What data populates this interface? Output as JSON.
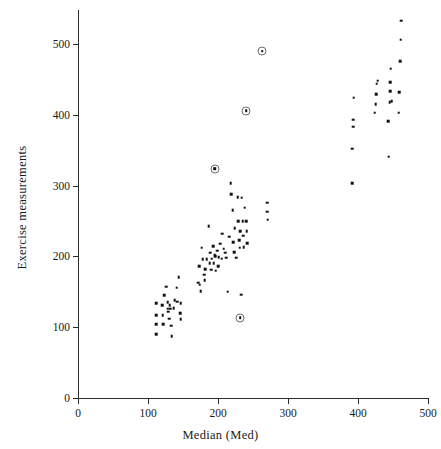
{
  "chart_data": {
    "type": "scatter",
    "title": "",
    "xlabel": "Median (Med)",
    "ylabel": "Exercise measurements",
    "xlim": [
      0,
      500
    ],
    "ylim": [
      0,
      545
    ],
    "xticks": [
      0,
      100,
      200,
      300,
      400,
      500
    ],
    "yticks": [
      0,
      100,
      200,
      300,
      400,
      500
    ],
    "xtick_labels": [
      "0",
      "100",
      "200",
      "300",
      "400",
      "500"
    ],
    "ytick_labels": [
      "0",
      "100",
      "200",
      "300",
      "400",
      "500"
    ],
    "grid": false,
    "legend": null,
    "marker": "small-filled-square",
    "marker_color": "#111111",
    "highlight_marker": "dot-in-open-circle",
    "highlight_marker_color": "#6d6d6d",
    "series": [
      {
        "name": "observations",
        "marker": "dot",
        "points": [
          [
            112,
            134
          ],
          [
            112,
            117
          ],
          [
            112,
            104
          ],
          [
            112,
            90
          ],
          [
            120,
            131
          ],
          [
            121,
            117
          ],
          [
            122,
            104
          ],
          [
            123,
            145
          ],
          [
            126,
            157
          ],
          [
            128,
            135
          ],
          [
            128,
            126
          ],
          [
            129,
            122
          ],
          [
            130,
            112
          ],
          [
            131,
            131
          ],
          [
            132,
            126
          ],
          [
            133,
            102
          ],
          [
            134,
            87
          ],
          [
            137,
            127
          ],
          [
            138,
            138
          ],
          [
            141,
            156
          ],
          [
            142,
            136
          ],
          [
            144,
            171
          ],
          [
            146,
            120
          ],
          [
            147,
            134
          ],
          [
            147,
            111
          ],
          [
            172,
            163
          ],
          [
            173,
            186
          ],
          [
            174,
            160
          ],
          [
            175,
            151
          ],
          [
            177,
            212
          ],
          [
            178,
            196
          ],
          [
            180,
            174
          ],
          [
            181,
            166
          ],
          [
            182,
            182
          ],
          [
            184,
            196
          ],
          [
            187,
            243
          ],
          [
            188,
            190
          ],
          [
            189,
            205
          ],
          [
            190,
            181
          ],
          [
            191,
            197
          ],
          [
            193,
            214
          ],
          [
            194,
            190
          ],
          [
            195,
            202
          ],
          [
            196,
            200
          ],
          [
            197,
            180
          ],
          [
            199,
            208
          ],
          [
            200,
            186
          ],
          [
            201,
            199
          ],
          [
            203,
            218
          ],
          [
            205,
            197
          ],
          [
            206,
            232
          ],
          [
            208,
            211
          ],
          [
            210,
            205
          ],
          [
            212,
            198
          ],
          [
            214,
            150
          ],
          [
            216,
            228
          ],
          [
            218,
            303
          ],
          [
            219,
            288
          ],
          [
            221,
            265
          ],
          [
            222,
            220
          ],
          [
            223,
            206
          ],
          [
            224,
            240
          ],
          [
            226,
            198
          ],
          [
            228,
            284
          ],
          [
            229,
            250
          ],
          [
            230,
            223
          ],
          [
            231,
            212
          ],
          [
            232,
            236
          ],
          [
            233,
            146
          ],
          [
            234,
            283
          ],
          [
            235,
            250
          ],
          [
            236,
            229
          ],
          [
            237,
            213
          ],
          [
            238,
            269
          ],
          [
            240,
            250
          ],
          [
            241,
            236
          ],
          [
            242,
            219
          ],
          [
            270,
            276
          ],
          [
            270,
            263
          ],
          [
            271,
            252
          ],
          [
            392,
            303
          ],
          [
            392,
            352
          ],
          [
            393,
            383
          ],
          [
            393,
            393
          ],
          [
            394,
            424
          ],
          [
            424,
            403
          ],
          [
            425,
            415
          ],
          [
            426,
            429
          ],
          [
            427,
            444
          ],
          [
            428,
            448
          ],
          [
            443,
            391
          ],
          [
            444,
            341
          ],
          [
            445,
            418
          ],
          [
            446,
            433
          ],
          [
            446,
            446
          ],
          [
            447,
            465
          ],
          [
            448,
            419
          ],
          [
            458,
            403
          ],
          [
            459,
            432
          ],
          [
            460,
            476
          ],
          [
            461,
            506
          ],
          [
            462,
            533
          ]
        ]
      },
      {
        "name": "highlighted-outliers",
        "marker": "dot-in-open-circle",
        "points": [
          [
            263,
            490
          ],
          [
            240,
            406
          ],
          [
            195,
            324
          ],
          [
            232,
            113
          ]
        ]
      }
    ]
  },
  "axes": {
    "x_title": "Median (Med)",
    "y_title": "Exercise measurements"
  }
}
